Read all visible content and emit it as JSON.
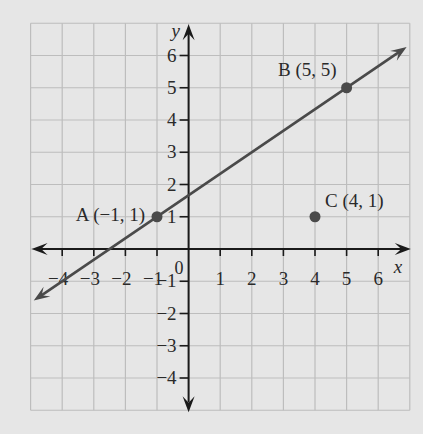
{
  "chart_data": {
    "type": "scatter",
    "title": "",
    "xlabel": "x",
    "ylabel": "y",
    "xlim": [
      -5,
      7
    ],
    "ylim": [
      -5,
      7
    ],
    "grid": true,
    "legend": null,
    "x_ticks": [
      -4,
      -3,
      -2,
      -1,
      1,
      2,
      3,
      4,
      5,
      6
    ],
    "x_tick_labels": [
      "−4",
      "−3",
      "−2",
      "−1",
      "1",
      "2",
      "3",
      "4",
      "5",
      "6"
    ],
    "y_ticks": [
      -4,
      -3,
      -2,
      -1,
      1,
      2,
      3,
      4,
      5,
      6
    ],
    "y_tick_labels": [
      "−4",
      "−3",
      "−2",
      "−1",
      "1",
      "2",
      "3",
      "4",
      "5",
      "6"
    ],
    "origin_label": "0",
    "points": [
      {
        "name": "A",
        "x": -1,
        "y": 1,
        "label": "A (−1, 1)"
      },
      {
        "name": "B",
        "x": 5,
        "y": 5,
        "label": "B (5, 5)"
      },
      {
        "name": "C",
        "x": 4,
        "y": 1,
        "label": "C (4, 1)"
      }
    ],
    "lines": [
      {
        "through": [
          "A",
          "B"
        ],
        "slope": 0.6667,
        "intercept": 1.6667,
        "style": "line with arrows at both ends"
      }
    ]
  },
  "colors": {
    "background": "#e6e6e6",
    "grid": "#bdbdbd",
    "axis": "#1a1a1a",
    "line": "#4a4a4a",
    "point": "#4a4a4a",
    "text": "#2a2a2a"
  }
}
